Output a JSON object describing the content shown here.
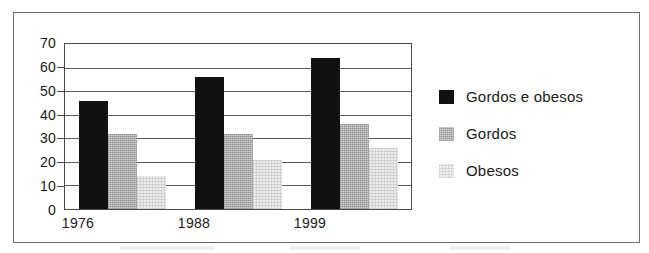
{
  "chart_data": {
    "type": "bar",
    "title": "",
    "xlabel": "",
    "ylabel": "",
    "categories": [
      "1976",
      "1988",
      "1999"
    ],
    "series": [
      {
        "name": "Gordos e obesos",
        "values": [
          46,
          56,
          64
        ],
        "color": "#111111"
      },
      {
        "name": "Gordos",
        "values": [
          32,
          32,
          36
        ],
        "color": "#d2d2d2"
      },
      {
        "name": "Obesos",
        "values": [
          14,
          21,
          26
        ],
        "color": "#ececec"
      }
    ],
    "ylim": [
      0,
      70
    ],
    "yticks": [
      0,
      10,
      20,
      30,
      40,
      50,
      60,
      70
    ],
    "ytick_labels": [
      "0",
      "10",
      "20",
      "30",
      "40",
      "50",
      "60",
      "70"
    ],
    "grid": true,
    "legend_position": "right"
  },
  "legend": {
    "items": [
      {
        "label": "Gordos e obesos"
      },
      {
        "label": "Gordos"
      },
      {
        "label": "Obesos"
      }
    ]
  },
  "axis": {
    "y_labels": [
      "70",
      "60",
      "50",
      "40",
      "30",
      "20",
      "10",
      "0"
    ],
    "x_labels": [
      "1976",
      "1988",
      "1999"
    ]
  }
}
